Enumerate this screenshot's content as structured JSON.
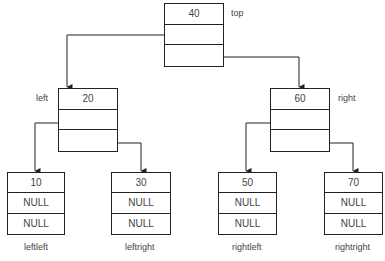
{
  "diagram": {
    "type": "binary-tree-linked-structure",
    "nodes": {
      "top": {
        "value": "40",
        "label": "top",
        "left": "left",
        "right": "right"
      },
      "left": {
        "value": "20",
        "label": "left",
        "left": "leftleft",
        "right": "leftright"
      },
      "right": {
        "value": "60",
        "label": "right",
        "left": "rightleft",
        "right": "rightright"
      },
      "leftleft": {
        "value": "10",
        "label": "leftleft",
        "left_ptr": "NULL",
        "right_ptr": "NULL"
      },
      "leftright": {
        "value": "30",
        "label": "leftright",
        "left_ptr": "NULL",
        "right_ptr": "NULL"
      },
      "rightleft": {
        "value": "50",
        "label": "rightleft",
        "left_ptr": "NULL",
        "right_ptr": "NULL"
      },
      "rightright": {
        "value": "70",
        "label": "rightright",
        "left_ptr": "NULL",
        "right_ptr": "NULL"
      }
    },
    "edges": [
      {
        "from": "top",
        "to": "left",
        "via": "left-pointer"
      },
      {
        "from": "top",
        "to": "right",
        "via": "right-pointer"
      },
      {
        "from": "left",
        "to": "leftleft",
        "via": "left-pointer"
      },
      {
        "from": "left",
        "to": "leftright",
        "via": "right-pointer"
      },
      {
        "from": "right",
        "to": "rightleft",
        "via": "left-pointer"
      },
      {
        "from": "right",
        "to": "rightright",
        "via": "right-pointer"
      }
    ],
    "colors": {
      "line": "#222222",
      "text": "#444444",
      "background": "#ffffff"
    }
  }
}
